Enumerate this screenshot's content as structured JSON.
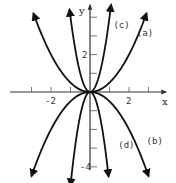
{
  "chart_data": {
    "type": "line",
    "title": "",
    "xlabel": "x",
    "ylabel": "y",
    "xlim": [
      -3,
      3.8
    ],
    "ylim": [
      -4.6,
      4.7
    ],
    "grid": false,
    "x_ticks": [
      -3,
      -2,
      -1,
      1,
      2,
      3
    ],
    "y_ticks": [
      -4,
      -3,
      -2,
      -1,
      1,
      2,
      3,
      4
    ],
    "x_tick_labels": [
      {
        "value": -2,
        "text": "-2"
      },
      {
        "value": 2,
        "text": "2"
      }
    ],
    "y_tick_labels": [
      {
        "value": 2,
        "text": "2"
      },
      {
        "value": -4,
        "text": "-4"
      }
    ],
    "series": [
      {
        "name": "(a)",
        "equation": "y ≈ x²/2 (estimated)",
        "coef": 0.5,
        "x_range": [
          -2.9,
          2.9
        ],
        "label_at": [
          2.4,
          3.0
        ]
      },
      {
        "name": "(b)",
        "equation": "y ≈ -x²/2 (estimated)",
        "coef": -0.5,
        "x_range": [
          -3.0,
          3.0
        ],
        "label_at": [
          2.9,
          -2.8
        ]
      },
      {
        "name": "(c)",
        "equation": "y ≈ 4x² (estimated)",
        "coef": 4,
        "x_range": [
          -1.05,
          1.08
        ],
        "label_at": [
          1.2,
          3.4
        ]
      },
      {
        "name": "(d)",
        "equation": "y ≈ -5x² (estimated)",
        "coef": -5,
        "x_range": [
          -1.0,
          0.95
        ],
        "label_at": [
          1.45,
          -3.0
        ]
      }
    ]
  },
  "colors": {
    "curve": "#111111",
    "axis": "#333333",
    "background": "#ffffff"
  }
}
